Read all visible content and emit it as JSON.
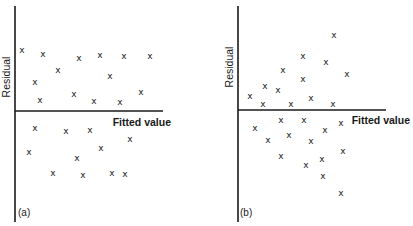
{
  "chart_data": [
    {
      "type": "scatter",
      "panel_label": "(a)",
      "xlabel": "Fitted value",
      "ylabel": "Residual",
      "marker": "x",
      "grid": false,
      "legend": null,
      "axis_pixels": {
        "x0": 15,
        "y0": 111,
        "xmax": 163,
        "ytop": 6,
        "ybottom": 222
      },
      "points": [
        {
          "x": 22,
          "y": 50
        },
        {
          "x": 43,
          "y": 54
        },
        {
          "x": 79,
          "y": 58
        },
        {
          "x": 100,
          "y": 55
        },
        {
          "x": 124,
          "y": 56
        },
        {
          "x": 150,
          "y": 56
        },
        {
          "x": 58,
          "y": 70
        },
        {
          "x": 35,
          "y": 82
        },
        {
          "x": 110,
          "y": 76
        },
        {
          "x": 40,
          "y": 100
        },
        {
          "x": 74,
          "y": 94
        },
        {
          "x": 94,
          "y": 101
        },
        {
          "x": 120,
          "y": 102
        },
        {
          "x": 141,
          "y": 92
        },
        {
          "x": 35,
          "y": 128
        },
        {
          "x": 29,
          "y": 152
        },
        {
          "x": 66,
          "y": 131
        },
        {
          "x": 90,
          "y": 130
        },
        {
          "x": 130,
          "y": 139
        },
        {
          "x": 101,
          "y": 148
        },
        {
          "x": 77,
          "y": 158
        },
        {
          "x": 53,
          "y": 173
        },
        {
          "x": 83,
          "y": 175
        },
        {
          "x": 112,
          "y": 173
        },
        {
          "x": 125,
          "y": 174
        }
      ],
      "description": "Residuals scattered evenly in a horizontal band around zero (constant variance)"
    },
    {
      "type": "scatter",
      "panel_label": "(b)",
      "xlabel": "Fitted value",
      "ylabel": "Residual",
      "marker": "x",
      "grid": false,
      "legend": null,
      "axis_pixels": {
        "x0": 238,
        "y0": 110,
        "xmax": 386,
        "ytop": 6,
        "ybottom": 222
      },
      "points": [
        {
          "x": 334,
          "y": 35
        },
        {
          "x": 303,
          "y": 56
        },
        {
          "x": 326,
          "y": 62
        },
        {
          "x": 283,
          "y": 70
        },
        {
          "x": 347,
          "y": 74
        },
        {
          "x": 303,
          "y": 79
        },
        {
          "x": 265,
          "y": 86
        },
        {
          "x": 278,
          "y": 90
        },
        {
          "x": 250,
          "y": 96
        },
        {
          "x": 263,
          "y": 104
        },
        {
          "x": 291,
          "y": 104
        },
        {
          "x": 311,
          "y": 98
        },
        {
          "x": 333,
          "y": 104
        },
        {
          "x": 281,
          "y": 120
        },
        {
          "x": 304,
          "y": 120
        },
        {
          "x": 341,
          "y": 123
        },
        {
          "x": 255,
          "y": 128
        },
        {
          "x": 325,
          "y": 130
        },
        {
          "x": 268,
          "y": 140
        },
        {
          "x": 289,
          "y": 135
        },
        {
          "x": 311,
          "y": 141
        },
        {
          "x": 281,
          "y": 156
        },
        {
          "x": 343,
          "y": 151
        },
        {
          "x": 306,
          "y": 165
        },
        {
          "x": 322,
          "y": 159
        },
        {
          "x": 323,
          "y": 176
        },
        {
          "x": 341,
          "y": 193
        }
      ],
      "description": "Residual spread increases with fitted value (funnel shape, non-constant variance)"
    }
  ],
  "panels": {
    "a": {
      "label": "(a)",
      "xlabel": "Fitted value",
      "ylabel": "Residual"
    },
    "b": {
      "label": "(b)",
      "xlabel": "Fitted value",
      "ylabel": "Residual"
    }
  },
  "marker_glyph": "x"
}
